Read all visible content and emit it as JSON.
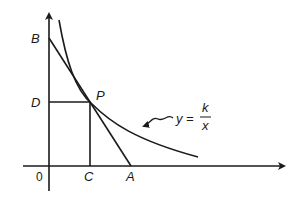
{
  "diagram": {
    "type": "geometry-graph",
    "labels": {
      "origin": "0",
      "B": "B",
      "D": "D",
      "P": "P",
      "C": "C",
      "A": "A"
    },
    "equation": {
      "lhs": "y =",
      "numerator": "k",
      "denominator": "x"
    },
    "colors": {
      "stroke": "#1a1a1a",
      "background": "#ffffff"
    }
  }
}
